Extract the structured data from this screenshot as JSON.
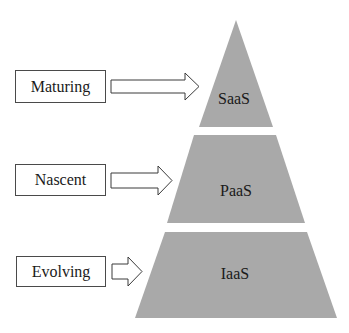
{
  "diagram": {
    "type": "pyramid",
    "fill_color": "#a9a9a9",
    "stage_labels": [
      {
        "label": "Maturing",
        "points_to": "SaaS"
      },
      {
        "label": "Nascent",
        "points_to": "PaaS"
      },
      {
        "label": "Evolving",
        "points_to": "IaaS"
      }
    ],
    "tiers": [
      {
        "label": "SaaS",
        "position": "top"
      },
      {
        "label": "PaaS",
        "position": "middle"
      },
      {
        "label": "IaaS",
        "position": "bottom"
      }
    ]
  }
}
